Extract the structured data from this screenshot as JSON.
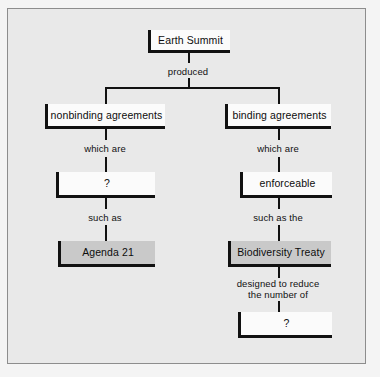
{
  "diagram": {
    "colors": {
      "page_background": "#f4f4f4",
      "frame_background": "#e9e9e9",
      "frame_border": "#8d8d8d",
      "node_fill_white": "#fbfbfb",
      "node_fill_gray": "#c9c9c9",
      "line": "#111111",
      "text": "#0d0d0d"
    },
    "nodes": [
      {
        "id": "earth_summit",
        "label": "Earth Summit",
        "fill": "white"
      },
      {
        "id": "nonbinding",
        "label": "nonbinding agreements",
        "fill": "white"
      },
      {
        "id": "binding",
        "label": "binding agreements",
        "fill": "white"
      },
      {
        "id": "left_unknown",
        "label": "?",
        "fill": "white"
      },
      {
        "id": "enforceable",
        "label": "enforceable",
        "fill": "white"
      },
      {
        "id": "agenda21",
        "label": "Agenda 21",
        "fill": "gray"
      },
      {
        "id": "biodiversity",
        "label": "Biodiversity Treaty",
        "fill": "gray"
      },
      {
        "id": "bottom_unknown",
        "label": "?",
        "fill": "white"
      }
    ],
    "edge_labels": [
      {
        "id": "produced",
        "text": "produced"
      },
      {
        "id": "which_are_left",
        "text": "which are"
      },
      {
        "id": "which_are_right",
        "text": "which are"
      },
      {
        "id": "such_as",
        "text": "such as"
      },
      {
        "id": "such_as_the",
        "text": "such as the"
      },
      {
        "id": "designed_to_reduce",
        "text": "designed to reduce\nthe number of"
      }
    ]
  }
}
